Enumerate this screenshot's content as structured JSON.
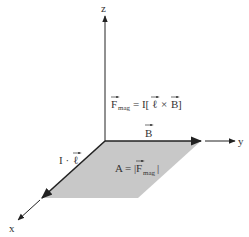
{
  "diagram": {
    "axes": {
      "z_label": "z",
      "y_label": "y",
      "x_label": "x"
    },
    "labels": {
      "force_lhs": "F",
      "force_sub": "mag",
      "force_rhs_prefix": "= I[",
      "force_l": "ℓ",
      "force_times": "×",
      "force_B": "B",
      "force_close": "]",
      "b_field": "B",
      "il_prefix": "I ·",
      "il_l": "ℓ",
      "area_prefix": "A = |",
      "area_F": "F",
      "area_sub": "mag",
      "area_close": "|"
    },
    "colors": {
      "plane_fill": "#c8c8c8",
      "line": "#222222"
    }
  }
}
